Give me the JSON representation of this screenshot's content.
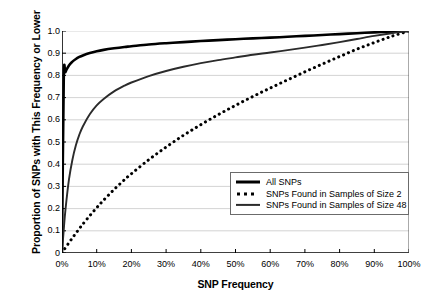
{
  "chart_data": {
    "type": "line",
    "title": "",
    "xlabel": "SNP Frequency",
    "ylabel": "Proportion of SNPs with This Frequency or Lower",
    "xlim": [
      0,
      100
    ],
    "ylim": [
      0,
      1.0
    ],
    "grid": "horizontal",
    "legend_position": "lower-right-inside",
    "xticks": [
      "0%",
      "10%",
      "20%",
      "30%",
      "40%",
      "50%",
      "60%",
      "70%",
      "80%",
      "90%",
      "100%"
    ],
    "xtick_values": [
      0,
      10,
      20,
      30,
      40,
      50,
      60,
      70,
      80,
      90,
      100
    ],
    "yticks": [
      "0",
      "0.1",
      "0.2",
      "0.3",
      "0.4",
      "0.5",
      "0.6",
      "0.7",
      "0.8",
      "0.9",
      "1.0"
    ],
    "ytick_values": [
      0,
      0.1,
      0.2,
      0.3,
      0.4,
      0.5,
      0.6,
      0.7,
      0.8,
      0.9,
      1.0
    ],
    "x": [
      0,
      0.5,
      1,
      2,
      3,
      4,
      5,
      6,
      8,
      10,
      12,
      15,
      18,
      20,
      25,
      30,
      35,
      40,
      45,
      50,
      55,
      60,
      65,
      70,
      75,
      80,
      85,
      90,
      95,
      100
    ],
    "series": [
      {
        "name": "All SNPs",
        "style": "solid",
        "width": "thick",
        "color": "#000000",
        "values": [
          0.0,
          0.78,
          0.815,
          0.845,
          0.862,
          0.874,
          0.883,
          0.89,
          0.901,
          0.909,
          0.915,
          0.922,
          0.928,
          0.931,
          0.939,
          0.945,
          0.95,
          0.955,
          0.959,
          0.963,
          0.967,
          0.97,
          0.974,
          0.978,
          0.982,
          0.986,
          0.99,
          0.994,
          0.997,
          1.0
        ]
      },
      {
        "name": "SNPs Found in Samples of Size 2",
        "style": "dotted",
        "width": "thick",
        "color": "#000000",
        "values": [
          0.0,
          0.012,
          0.024,
          0.046,
          0.068,
          0.089,
          0.11,
          0.13,
          0.168,
          0.204,
          0.238,
          0.286,
          0.33,
          0.357,
          0.42,
          0.477,
          0.53,
          0.578,
          0.623,
          0.665,
          0.705,
          0.743,
          0.78,
          0.816,
          0.851,
          0.885,
          0.918,
          0.948,
          0.976,
          1.0
        ]
      },
      {
        "name": "SNPs Found in Samples of Size 48",
        "style": "solid",
        "width": "thin",
        "color": "#2b2b2b",
        "values": [
          0.0,
          0.105,
          0.195,
          0.33,
          0.42,
          0.485,
          0.533,
          0.57,
          0.625,
          0.665,
          0.694,
          0.728,
          0.754,
          0.768,
          0.797,
          0.82,
          0.839,
          0.855,
          0.869,
          0.881,
          0.893,
          0.903,
          0.914,
          0.925,
          0.937,
          0.95,
          0.964,
          0.978,
          0.99,
          1.0
        ]
      }
    ]
  },
  "legend": {
    "entries": [
      {
        "label": "All SNPs"
      },
      {
        "label": "SNPs Found in Samples of Size 2"
      },
      {
        "label": "SNPs Found in Samples of Size 48"
      }
    ]
  }
}
